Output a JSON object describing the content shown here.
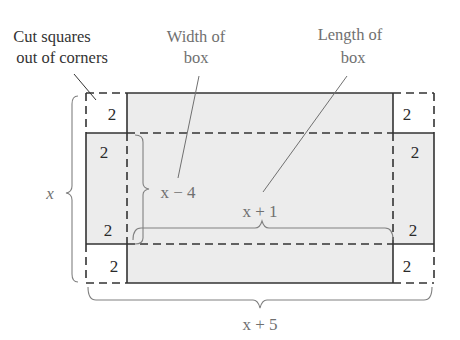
{
  "diagram": {
    "type": "box-from-cut-sheet",
    "colors": {
      "fill": "#ececec",
      "solid_line": "#333333",
      "dashed_line": "#333333",
      "annotation_line": "#808080",
      "dark_text": "#333333",
      "gray_text": "#707070"
    },
    "callouts": {
      "cut_squares": {
        "line1": "Cut squares",
        "line2": "out of corners"
      },
      "width_of_box": {
        "line1": "Width of",
        "line2": "box"
      },
      "length_of_box": {
        "line1": "Length of",
        "line2": "box"
      }
    },
    "corner_labels": {
      "top_left_corner": "2",
      "top_left_side": "2",
      "bottom_left_side": "2",
      "bottom_left_corner": "2",
      "top_right_corner": "2",
      "top_right_side": "2",
      "bottom_right_side": "2",
      "bottom_right_corner": "2"
    },
    "dimensions": {
      "outer_height": "x",
      "inner_width": "x − 4",
      "inner_length": "x + 1",
      "outer_width": "x + 5"
    }
  }
}
